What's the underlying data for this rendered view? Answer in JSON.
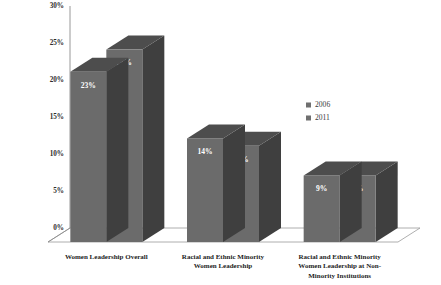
{
  "chart_data": {
    "type": "bar",
    "title": "",
    "subtitle": "",
    "xlabel": "",
    "ylabel": "",
    "ylim": [
      0,
      30
    ],
    "yticks": [
      "0%",
      "5%",
      "10%",
      "15%",
      "20%",
      "25%",
      "30%"
    ],
    "ytick_values": [
      0,
      5,
      10,
      15,
      20,
      25,
      30
    ],
    "grid": false,
    "legend_position": "right-middle",
    "three_d": true,
    "value_label_suffix": "%",
    "categories": [
      "Women Leadership Overall",
      "Racial and Ethnic Minority Women Leadership",
      "Racial and Ethnic Minority Women Leadership at Non-Minority Institutions"
    ],
    "category_lines": [
      [
        "Women Leadership Overall"
      ],
      [
        "Racial and Ethnic Minority",
        "Women Leadership"
      ],
      [
        "Racial and Ethnic Minority",
        "Women Leadership at Non-",
        "Minority Institutions"
      ]
    ],
    "series": [
      {
        "name": "2006",
        "values": [
          23,
          14,
          9
        ],
        "labels": [
          "23%",
          "14%",
          "9%"
        ]
      },
      {
        "name": "2011",
        "values": [
          26,
          13,
          9
        ],
        "labels": [
          "26%",
          "13%",
          "9%"
        ]
      }
    ]
  },
  "legend": {
    "items": [
      {
        "label": "2006",
        "color": "#6f6f6f"
      },
      {
        "label": "2011",
        "color": "#6f6f6f"
      }
    ]
  },
  "colors": {
    "bar_front": "#6b6b6b",
    "bar_top": "#4d4d4d",
    "bar_side": "#3f3f3f",
    "axis": "#8d8d8d",
    "background": "#ffffff",
    "value_text": "#ffffff",
    "tick_text": "#2b2b2b",
    "category_text": "#1d1d1d"
  }
}
